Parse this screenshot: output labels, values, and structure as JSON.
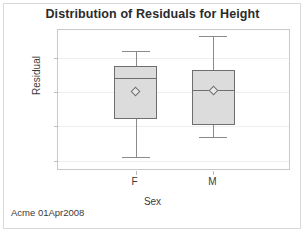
{
  "chart_data": {
    "type": "box",
    "title": "Distribution of Residuals for Height",
    "xlabel": "Sex",
    "ylabel": "Residual",
    "categories": [
      "F",
      "M"
    ],
    "ylim": [
      -11.5,
      9.0
    ],
    "yticks": [
      5,
      0,
      -5,
      -10
    ],
    "ytick_labels": [
      "5",
      "0",
      "-5",
      "-10"
    ],
    "grid": true,
    "legend": "none",
    "footnote": "Acme 01Apr2008",
    "boxes": [
      {
        "category": "F",
        "whisker_low": -9.4,
        "q1": -4.0,
        "median": 2.0,
        "q3": 3.8,
        "whisker_high": 5.9,
        "mean": 0.1
      },
      {
        "category": "M",
        "whisker_low": -6.5,
        "q1": -4.8,
        "median": 0.3,
        "q3": 3.2,
        "whisker_high": 8.2,
        "mean": 0.2
      }
    ],
    "colors": {
      "box_fill": "#dcdcdc",
      "box_edge": "#6e6e6e",
      "whisker": "#8a8a8a",
      "grid": "#eeeeee",
      "axis": "#c9c9c9",
      "text": "#3a3a3a"
    }
  }
}
